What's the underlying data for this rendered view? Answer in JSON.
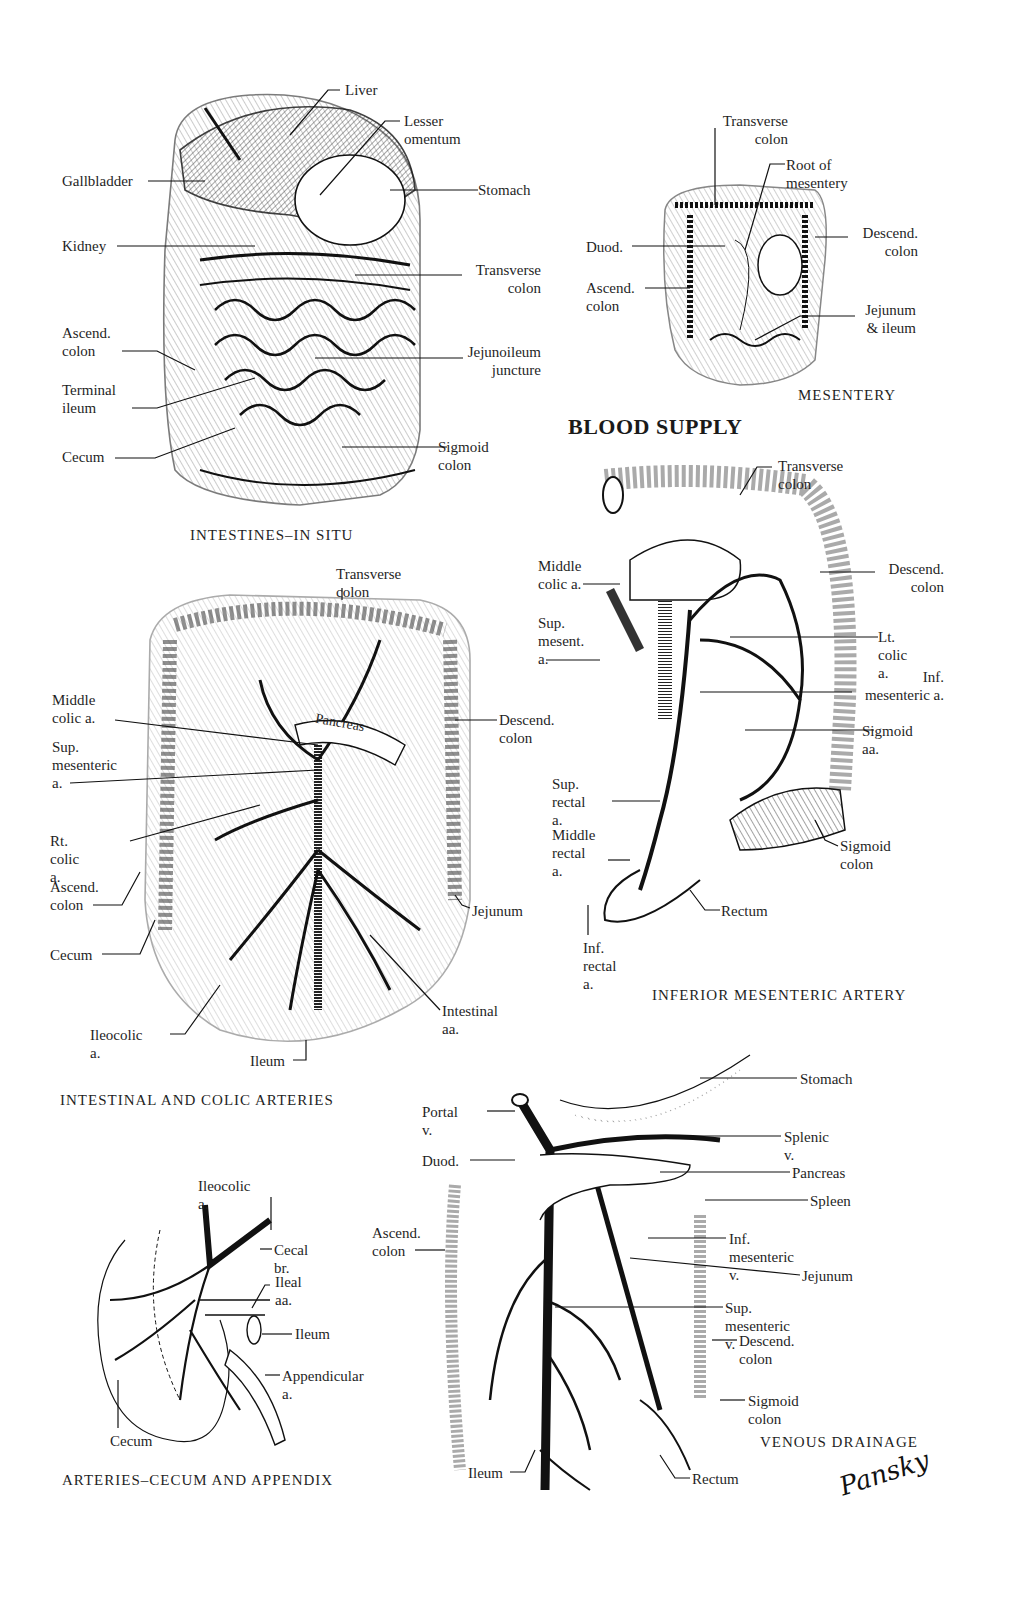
{
  "plate": {
    "section_heading": "BLOOD SUPPLY",
    "signature": "Pansky"
  },
  "panels": {
    "in_situ": {
      "caption": "INTESTINES–IN SITU",
      "labels": {
        "liver": "Liver",
        "lesser_omentum": "Lesser omentum",
        "gallbladder": "Gallbladder",
        "stomach": "Stomach",
        "kidney": "Kidney",
        "transverse_colon": "Transverse\ncolon",
        "ascend_colon": "Ascend.\ncolon",
        "jejunoileum": "Jejunoileum\njuncture",
        "terminal_ileum": "Terminal\nileum",
        "cecum": "Cecum",
        "sigmoid_colon": "Sigmoid colon"
      }
    },
    "mesentery": {
      "caption": "MESENTERY",
      "labels": {
        "transverse_colon": "Transverse\ncolon",
        "root_of_mesentery": "Root of mesentery",
        "duod": "Duod.",
        "descend_colon": "Descend.\ncolon",
        "ascend_colon": "Ascend.\ncolon",
        "jejunum_ileum": "Jejunum\n& ileum"
      }
    },
    "intestinal_colic": {
      "caption": "INTESTINAL AND COLIC ARTERIES",
      "labels": {
        "transverse_colon": "Transverse colon",
        "middle_colic": "Middle\ncolic a.",
        "pancreas": "Pancreas",
        "descend_colon": "Descend. colon",
        "sup_mesenteric": "Sup.\nmesenteric\na.",
        "rt_colic": "Rt. colic a.",
        "ascend_colon": "Ascend.\ncolon",
        "jejunum": "Jejunum",
        "cecum": "Cecum",
        "intestinal_aa": "Intestinal aa.",
        "ileocolic": "Ileocolic a.",
        "ileum": "Ileum"
      }
    },
    "inferior_mesenteric": {
      "caption": "INFERIOR MESENTERIC ARTERY",
      "labels": {
        "transverse_colon": "Transverse colon",
        "middle_colic": "Middle\ncolic a.",
        "descend_colon": "Descend.\ncolon",
        "sup_mesent": "Sup.\nmesent.\na.",
        "lt_colic": "Lt. colic a.",
        "inf_mesenteric": "Inf.\nmesenteric a.",
        "sigmoid_aa": "Sigmoid aa.",
        "sup_rectal": "Sup.\nrectal a.",
        "middle_rectal": "Middle\nrectal a.",
        "sigmoid_colon": "Sigmoid colon",
        "rectum": "Rectum",
        "inf_rectal": "Inf.\nrectal a."
      }
    },
    "cecum_appendix": {
      "caption": "ARTERIES–CECUM AND APPENDIX",
      "labels": {
        "ileocolic": "Ileocolic a.",
        "cecal_br": "Cecal br.",
        "ileal_aa": "Ileal aa.",
        "ileum": "Ileum",
        "appendicular": "Appendicular a.",
        "cecum": "Cecum"
      }
    },
    "venous": {
      "caption": "VENOUS DRAINAGE",
      "labels": {
        "stomach": "Stomach",
        "portal_v": "Portal v.",
        "splenic_v": "Splenic v.",
        "duod": "Duod.",
        "pancreas": "Pancreas",
        "spleen": "Spleen",
        "ascend_colon": "Ascend.\ncolon",
        "inf_mesenteric_v": "Inf. mesenteric v.",
        "jejunum": "Jejunum",
        "sup_mesenteric_v": "Sup. mesenteric v.",
        "descend_colon": "Descend. colon",
        "sigmoid_colon": "Sigmoid colon",
        "ileum": "Ileum",
        "rectum": "Rectum"
      }
    }
  }
}
